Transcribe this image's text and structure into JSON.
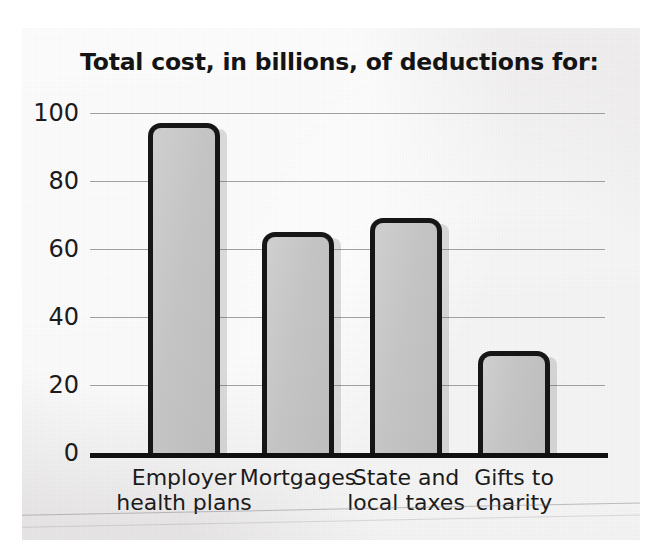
{
  "chart_data": {
    "type": "bar",
    "title": "Total cost, in billions, of deductions for:",
    "xlabel": "",
    "ylabel": "",
    "ylim": [
      0,
      100
    ],
    "yticks": [
      "100",
      "80",
      "60",
      "40",
      "20",
      "0"
    ],
    "ytick_values": [
      100,
      80,
      60,
      40,
      20,
      0
    ],
    "grid": "horizontal",
    "legend": "none",
    "categories": [
      "Employer\nhealth plans",
      "Mortgages",
      "State and\nlocal taxes",
      "Gifts to\ncharity"
    ],
    "values": [
      97,
      65,
      69,
      30
    ],
    "units": "billions of dollars"
  },
  "style": {
    "bar_fill": "#c6c6c6",
    "bar_outline": "#161616",
    "gridline_color": "#8e8e93",
    "axis_color": "#101010",
    "text_color": "#1b1b1b",
    "panel_background": "#eceaea",
    "page_background": "#ffffff"
  }
}
